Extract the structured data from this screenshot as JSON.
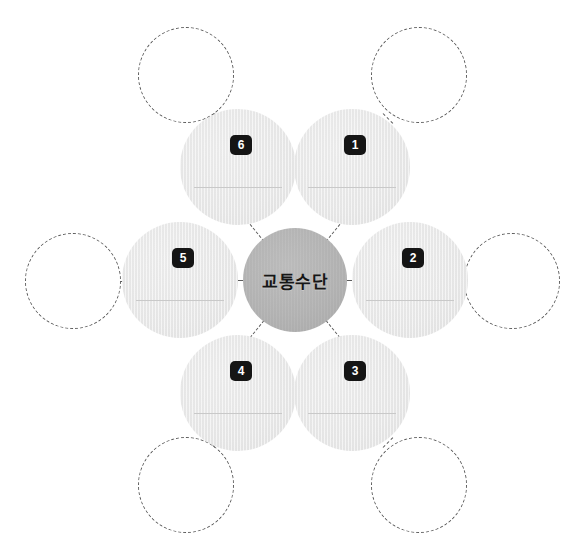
{
  "diagram": {
    "title": "교통수단",
    "type": "hub-and-spoke worksheet",
    "center": {
      "label": "교통수단",
      "color": "#b4b4b4",
      "cx": 295,
      "cy": 280,
      "diameter": 104
    },
    "petal_color": "#e8e8e8",
    "badge_color": "#151515",
    "badge_text_color": "#ffffff",
    "dash_color": "#5c5c5c",
    "writeline_color": "#c9c9c9",
    "petals": [
      {
        "number": "1",
        "position": "top-right",
        "cx": 352,
        "cy": 167,
        "diameter": 116,
        "badge_x": 50,
        "badge_y": 26,
        "line_y": 78,
        "line_x": 14,
        "line_w": 88
      },
      {
        "number": "2",
        "position": "right",
        "cx": 410,
        "cy": 280,
        "diameter": 116,
        "badge_x": 50,
        "badge_y": 26,
        "line_y": 78,
        "line_x": 14,
        "line_w": 88
      },
      {
        "number": "3",
        "position": "bottom-right",
        "cx": 352,
        "cy": 393,
        "diameter": 116,
        "badge_x": 50,
        "badge_y": 26,
        "line_y": 78,
        "line_x": 14,
        "line_w": 88
      },
      {
        "number": "4",
        "position": "bottom-left",
        "cx": 238,
        "cy": 393,
        "diameter": 116,
        "badge_x": 50,
        "badge_y": 26,
        "line_y": 78,
        "line_x": 14,
        "line_w": 88
      },
      {
        "number": "5",
        "position": "left",
        "cx": 180,
        "cy": 280,
        "diameter": 116,
        "badge_x": 50,
        "badge_y": 26,
        "line_y": 78,
        "line_x": 14,
        "line_w": 88
      },
      {
        "number": "6",
        "position": "top-left",
        "cx": 238,
        "cy": 167,
        "diameter": 116,
        "badge_x": 50,
        "badge_y": 26,
        "line_y": 78,
        "line_x": 14,
        "line_w": 88
      }
    ],
    "blank_circles": [
      {
        "name": "top-left-blank",
        "cx": 186,
        "cy": 75,
        "diameter": 96
      },
      {
        "name": "top-right-blank",
        "cx": 419,
        "cy": 75,
        "diameter": 96
      },
      {
        "name": "left-blank",
        "cx": 73,
        "cy": 281,
        "diameter": 96
      },
      {
        "name": "right-blank",
        "cx": 512,
        "cy": 281,
        "diameter": 96
      },
      {
        "name": "bottom-left-blank",
        "cx": 186,
        "cy": 485,
        "diameter": 96
      },
      {
        "name": "bottom-right-blank",
        "cx": 419,
        "cy": 485,
        "diameter": 96
      }
    ],
    "connectors": [
      {
        "name": "hub-to-1",
        "x1": 326,
        "y1": 241,
        "x2": 343,
        "y2": 220
      },
      {
        "name": "hub-to-2",
        "x1": 347,
        "y1": 280,
        "x2": 352,
        "y2": 280
      },
      {
        "name": "hub-to-3",
        "x1": 326,
        "y1": 320,
        "x2": 343,
        "y2": 341
      },
      {
        "name": "hub-to-4",
        "x1": 264,
        "y1": 320,
        "x2": 247,
        "y2": 341
      },
      {
        "name": "hub-to-5",
        "x1": 243,
        "y1": 280,
        "x2": 238,
        "y2": 280
      },
      {
        "name": "hub-to-6",
        "x1": 264,
        "y1": 241,
        "x2": 247,
        "y2": 220
      },
      {
        "name": "blank-to-6",
        "x1": 215,
        "y1": 113,
        "x2": 205,
        "y2": 123
      },
      {
        "name": "blank-to-1",
        "x1": 383,
        "y1": 113,
        "x2": 393,
        "y2": 123
      },
      {
        "name": "blank-to-5",
        "x1": 121,
        "y1": 281,
        "x2": 133,
        "y2": 281
      },
      {
        "name": "blank-to-2",
        "x1": 452,
        "y1": 281,
        "x2": 464,
        "y2": 281
      },
      {
        "name": "blank-to-4",
        "x1": 215,
        "y1": 447,
        "x2": 205,
        "y2": 437
      },
      {
        "name": "blank-to-3",
        "x1": 383,
        "y1": 447,
        "x2": 393,
        "y2": 437
      }
    ]
  }
}
